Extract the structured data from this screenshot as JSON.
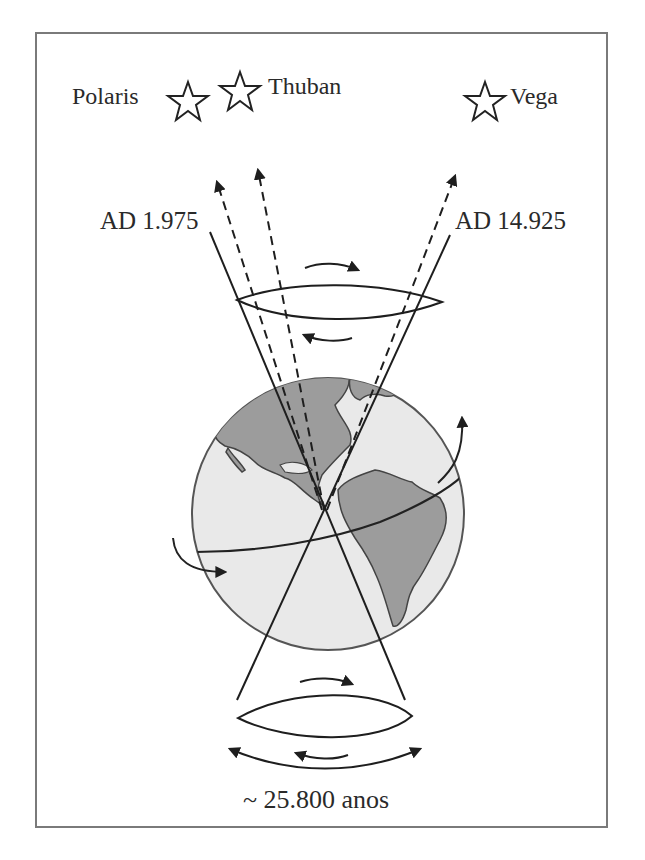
{
  "diagram": {
    "type": "precession-of-earth-axis",
    "stars": [
      {
        "name": "Polaris",
        "icon": "star-outline-icon"
      },
      {
        "name": "Thuban",
        "icon": "star-outline-icon"
      },
      {
        "name": "Vega",
        "icon": "star-outline-icon"
      }
    ],
    "axis_labels": {
      "left": "AD 1.975",
      "right": "AD 14.925"
    },
    "period_label": "~ 25.800 anos",
    "colors": {
      "line": "#1e1e1e",
      "frame": "#7a7a7a",
      "ocean": "#e8e8e8",
      "land": "#9a9a9a",
      "text": "#2a2a2a"
    }
  }
}
